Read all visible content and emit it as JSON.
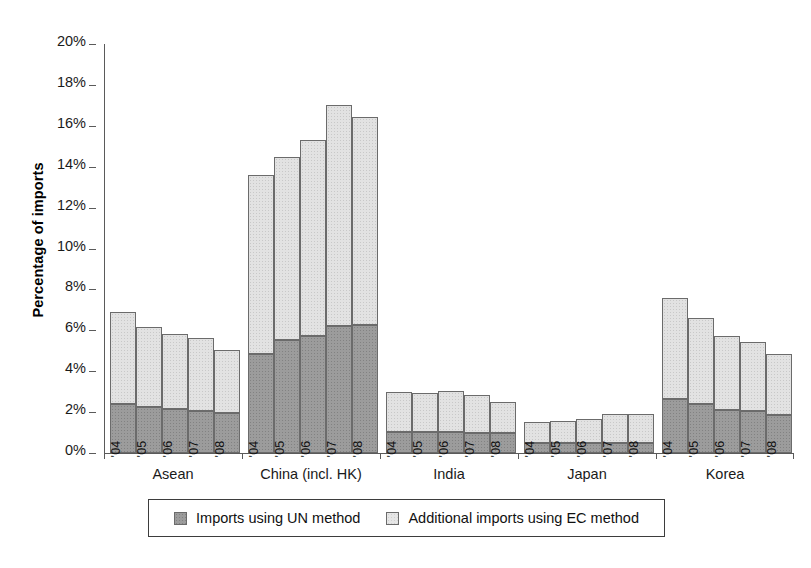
{
  "chart_data": {
    "type": "bar",
    "stacked": true,
    "title": "",
    "subtitle": "",
    "xlabel": "",
    "ylabel": "Percentage of imports",
    "ylim": [
      0,
      20
    ],
    "ytick_labels": [
      "0%",
      "2%",
      "4%",
      "6%",
      "8%",
      "10%",
      "12%",
      "14%",
      "16%",
      "18%",
      "20%"
    ],
    "ytick_values": [
      0,
      2,
      4,
      6,
      8,
      10,
      12,
      14,
      16,
      18,
      20
    ],
    "grid": false,
    "legend_position": "bottom",
    "value_unit": "%",
    "categories": [
      "Asean",
      "China (incl. HK)",
      "India",
      "Japan",
      "Korea"
    ],
    "subcategories": [
      "'04",
      "'05",
      "'06",
      "'07",
      "'08"
    ],
    "series": [
      {
        "name": "Imports using UN method",
        "color": "#9c9c9c",
        "values": [
          [
            2.4,
            2.25,
            2.15,
            2.05,
            1.95
          ],
          [
            4.85,
            5.55,
            5.7,
            6.2,
            6.25
          ],
          [
            1.05,
            1.05,
            1.05,
            1.0,
            1.0
          ],
          [
            0.5,
            0.5,
            0.5,
            0.5,
            0.5
          ],
          [
            2.65,
            2.4,
            2.1,
            2.05,
            1.85
          ]
        ]
      },
      {
        "name": "Additional imports using EC method",
        "color": "#e2e2e2",
        "values": [
          [
            4.5,
            3.9,
            3.65,
            3.55,
            3.1
          ],
          [
            8.75,
            8.95,
            9.6,
            10.8,
            10.2
          ],
          [
            1.95,
            1.9,
            2.0,
            1.85,
            1.5
          ],
          [
            1.0,
            1.05,
            1.15,
            1.4,
            1.4
          ],
          [
            4.95,
            4.2,
            3.6,
            3.4,
            3.0
          ]
        ]
      }
    ],
    "totals": [
      [
        6.9,
        6.15,
        5.8,
        5.6,
        5.05
      ],
      [
        13.6,
        14.5,
        15.3,
        17.0,
        16.45
      ],
      [
        3.0,
        2.95,
        3.05,
        2.85,
        2.5
      ],
      [
        1.5,
        1.55,
        1.65,
        1.9,
        1.9
      ],
      [
        7.6,
        6.6,
        5.7,
        5.45,
        4.85
      ]
    ]
  },
  "legend": {
    "items": [
      {
        "label": "Imports using UN method",
        "swatch": "un"
      },
      {
        "label": "Additional imports using EC method",
        "swatch": "ec"
      }
    ]
  }
}
